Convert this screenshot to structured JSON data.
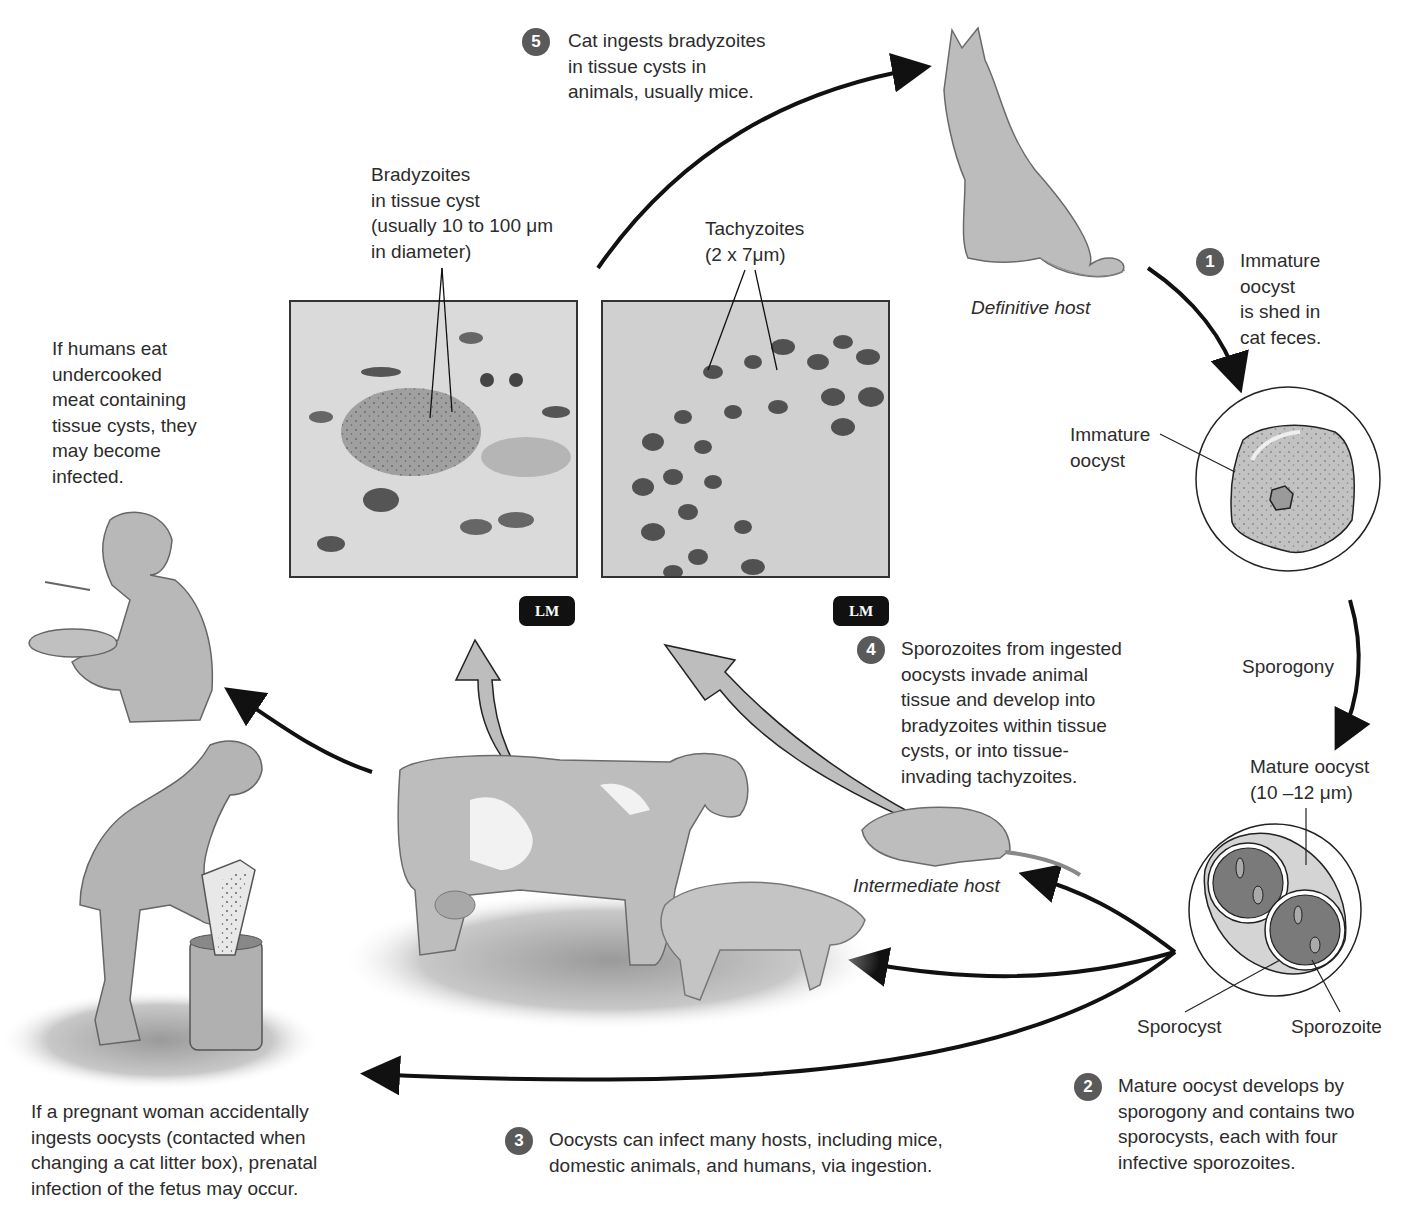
{
  "diagram": {
    "steps": [
      {
        "number": "1",
        "lines": [
          "Immature",
          "oocyst",
          "is shed in",
          "cat feces."
        ]
      },
      {
        "number": "2",
        "lines": [
          "Mature oocyst develops by",
          "sporogony and contains two",
          "sporocysts, each with four",
          "infective sporozoites."
        ]
      },
      {
        "number": "3",
        "lines": [
          "Oocysts can infect many hosts, including mice,",
          "domestic animals, and humans, via ingestion."
        ]
      },
      {
        "number": "4",
        "lines": [
          "Sporozoites from ingested",
          "oocysts invade animal",
          "tissue and develop into",
          "bradyzoites within tissue",
          "cysts, or into tissue-",
          "invading tachyzoites."
        ]
      },
      {
        "number": "5",
        "lines": [
          "Cat ingests bradyzoites",
          "in tissue cysts in",
          "animals, usually mice."
        ]
      }
    ],
    "labels": {
      "definitive_host": "Definitive host",
      "intermediate_host": "Intermediate host",
      "immature_oocyst": [
        "Immature",
        "oocyst"
      ],
      "sporogony": "Sporogony",
      "mature_oocyst": [
        "Mature oocyst",
        "(10 –12 μm)"
      ],
      "sporocyst": "Sporocyst",
      "sporozoite": "Sporozoite",
      "bradyzoites": [
        "Bradyzoites",
        "in tissue cyst",
        "(usually 10 to 100 μm",
        "in diameter)"
      ],
      "tachyzoites": [
        "Tachyzoites",
        "(2 x 7μm)"
      ],
      "lm_left": "LM",
      "lm_right": "LM"
    },
    "notes": {
      "humans_eat": [
        "If humans eat",
        "undercooked",
        "meat containing",
        "tissue cysts, they",
        "may become",
        "infected."
      ],
      "pregnant_woman": [
        "If a pregnant woman accidentally",
        "ingests oocysts (contacted when",
        "changing a cat litter box), prenatal",
        "infection of the fetus may occur."
      ]
    },
    "colors": {
      "badge": "#5a5a5a",
      "illustration_fill": "#b9b9b9",
      "arrow": "#111111",
      "text": "#2c2c2c"
    }
  }
}
